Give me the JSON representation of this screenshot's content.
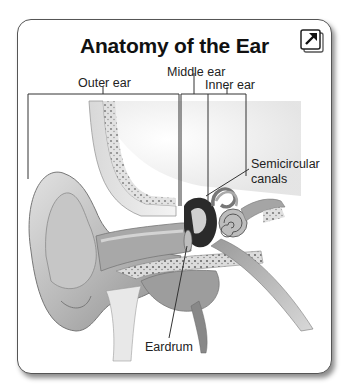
{
  "figure": {
    "title": "Anatomy of the Ear",
    "expand_icon": "expand-arrow-icon",
    "labels": {
      "outer_ear": "Outer ear",
      "middle_ear": "Middle ear",
      "inner_ear": "Inner ear",
      "semicircular_line1": "Semicircular",
      "semicircular_line2": "canals",
      "eardrum": "Eardrum"
    }
  }
}
